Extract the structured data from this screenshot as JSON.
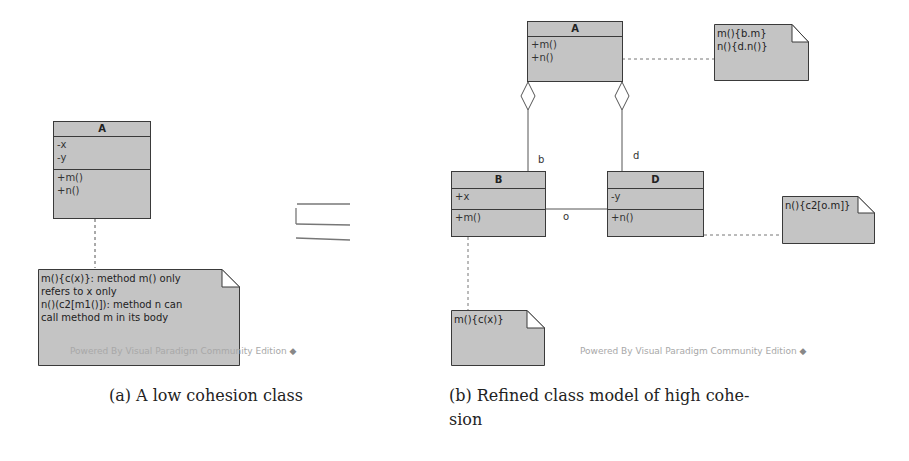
{
  "diagram_a": {
    "class_A": {
      "name": "A",
      "attributes": [
        "-x",
        "-y"
      ],
      "operations": [
        "+m()",
        "+n()"
      ]
    },
    "note": {
      "lines": [
        "m(){c(x)}: method m() only",
        "refers to x only",
        "n()(c2[m1()]): method n can",
        "call method m in its body"
      ]
    },
    "watermark": "Powered By Visual Paradigm Community Edition",
    "caption": "(a) A low cohesion class"
  },
  "relation_symbol": "⊑",
  "diagram_b": {
    "class_A": {
      "name": "A",
      "operations": [
        "+m()",
        "+n()"
      ]
    },
    "class_B": {
      "name": "B",
      "attributes": [
        "+x"
      ],
      "operations": [
        "+m()"
      ]
    },
    "class_D": {
      "name": "D",
      "attributes": [
        "-y"
      ],
      "operations": [
        "+n()"
      ]
    },
    "role_b": "b",
    "role_d": "d",
    "assoc_label": "o",
    "note_A": {
      "lines": [
        "m(){b.m}",
        "n(){d.n()}"
      ]
    },
    "note_B": {
      "lines": [
        "m(){c(x)}"
      ]
    },
    "note_D": {
      "lines": [
        "n(){c2[o.m]}"
      ]
    },
    "watermark": "Powered By Visual Paradigm Community Edition",
    "caption_line1": "(b) Refined class model of high cohe-",
    "caption_line2": "sion"
  }
}
